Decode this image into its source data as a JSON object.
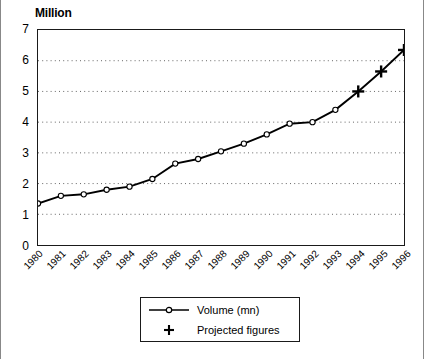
{
  "chart_data": {
    "type": "line",
    "title": "",
    "ylabel": "Million",
    "xlabel": "",
    "ylim": [
      0,
      7
    ],
    "yticks": [
      0,
      1,
      2,
      3,
      4,
      5,
      6,
      7
    ],
    "grid": true,
    "gridlines_at": [
      1,
      2,
      3,
      4,
      5,
      6
    ],
    "legend_position": "bottom",
    "categories": [
      "1980",
      "1981",
      "1982",
      "1983",
      "1984",
      "1985",
      "1986",
      "1987",
      "1988",
      "1989",
      "1990",
      "1991",
      "1992",
      "1993",
      "1994",
      "1995",
      "1996"
    ],
    "series": [
      {
        "name": "Volume (mn)",
        "marker": "open-circle",
        "values": [
          1.35,
          1.6,
          1.65,
          1.8,
          1.9,
          2.15,
          2.65,
          2.8,
          3.05,
          3.3,
          3.6,
          3.95,
          4.0,
          4.4,
          null,
          null,
          null
        ]
      },
      {
        "name": "Projected figures",
        "marker": "plus",
        "values": [
          null,
          null,
          null,
          null,
          null,
          null,
          null,
          null,
          null,
          null,
          null,
          null,
          null,
          null,
          5.0,
          5.65,
          6.35
        ]
      }
    ]
  },
  "axis_title": "Million",
  "legend": {
    "entries": [
      {
        "label": "Volume (mn)",
        "key": "line-with-open-circle-marker"
      },
      {
        "label": "Projected figures",
        "key": "plus-marker"
      }
    ]
  }
}
